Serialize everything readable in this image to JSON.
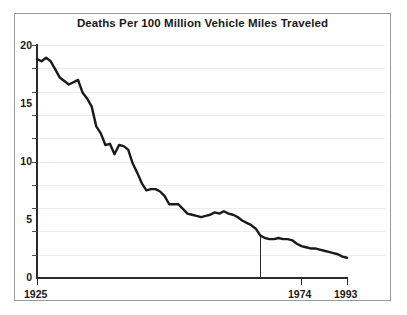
{
  "chart_data": {
    "type": "line",
    "title": "Deaths Per 100 Million Vehicle Miles Traveled",
    "xlabel": "",
    "ylabel": "",
    "xlim": [
      1925,
      1993
    ],
    "ylim": [
      0,
      20
    ],
    "grid": true,
    "grid_axis": "y",
    "grid_interval": 2,
    "legend": "none",
    "x_tick_labels": [
      "1925",
      "1974",
      "1993"
    ],
    "x_tick_values": [
      1925,
      1974,
      1993
    ],
    "y_tick_labels": [
      "0",
      "5",
      "10",
      "15",
      "20"
    ],
    "y_tick_values": [
      0,
      5,
      10,
      15,
      20
    ],
    "annotations": [
      {
        "name": "year-1974-marker",
        "type": "vertical-line",
        "x": 1974,
        "y_top": 3.6,
        "y_bottom": 0
      }
    ],
    "series": [
      {
        "name": "Deaths per 100 million vehicle miles traveled",
        "color": "#1a1a1a",
        "x": [
          1925,
          1926,
          1927,
          1928,
          1929,
          1930,
          1931,
          1932,
          1933,
          1934,
          1935,
          1936,
          1937,
          1938,
          1939,
          1940,
          1941,
          1942,
          1943,
          1944,
          1945,
          1946,
          1947,
          1948,
          1949,
          1950,
          1951,
          1952,
          1953,
          1954,
          1955,
          1956,
          1957,
          1958,
          1959,
          1960,
          1961,
          1962,
          1963,
          1964,
          1965,
          1966,
          1967,
          1968,
          1969,
          1970,
          1971,
          1972,
          1973,
          1974,
          1975,
          1976,
          1977,
          1978,
          1979,
          1980,
          1981,
          1982,
          1983,
          1984,
          1985,
          1986,
          1987,
          1988,
          1989,
          1990,
          1991,
          1992,
          1993
        ],
        "values": [
          18.8,
          18.6,
          18.9,
          18.6,
          17.9,
          17.2,
          16.9,
          16.6,
          16.8,
          17.0,
          15.9,
          15.4,
          14.7,
          13.0,
          12.4,
          11.4,
          11.5,
          10.6,
          11.4,
          11.3,
          11.0,
          9.8,
          9.0,
          8.1,
          7.5,
          7.6,
          7.6,
          7.4,
          7.0,
          6.3,
          6.3,
          6.3,
          5.9,
          5.5,
          5.4,
          5.3,
          5.2,
          5.3,
          5.4,
          5.6,
          5.5,
          5.7,
          5.5,
          5.4,
          5.2,
          4.9,
          4.7,
          4.5,
          4.2,
          3.6,
          3.4,
          3.3,
          3.3,
          3.4,
          3.3,
          3.3,
          3.2,
          2.9,
          2.7,
          2.6,
          2.5,
          2.5,
          2.4,
          2.3,
          2.2,
          2.1,
          2.0,
          1.8,
          1.7
        ]
      }
    ]
  },
  "axis": {
    "y_labels": [
      "20",
      "15",
      "10",
      "5",
      "0"
    ],
    "x_labels": [
      "1925",
      "1974",
      "1993"
    ]
  }
}
